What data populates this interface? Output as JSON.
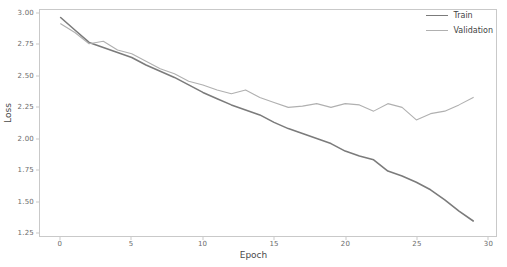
{
  "chart_data": {
    "type": "line",
    "title": "",
    "xlabel": "Epoch",
    "ylabel": "Loss",
    "xlim": [
      -1.45,
      30.6
    ],
    "ylim": [
      1.22,
      3.03
    ],
    "xticks": [
      0,
      5,
      10,
      15,
      20,
      25,
      30
    ],
    "xtick_labels": [
      "0",
      "5",
      "10",
      "15",
      "20",
      "25",
      "30"
    ],
    "yticks": [
      1.25,
      1.5,
      1.75,
      2.0,
      2.25,
      2.5,
      2.75,
      3.0
    ],
    "ytick_labels": [
      "1.25",
      "1.50",
      "1.75",
      "2.00",
      "2.25",
      "2.50",
      "2.75",
      "3.00"
    ],
    "grid": false,
    "legend_position": "upper right",
    "x": [
      0,
      1,
      2,
      3,
      4,
      5,
      6,
      7,
      8,
      9,
      10,
      11,
      12,
      13,
      14,
      15,
      16,
      17,
      18,
      19,
      20,
      21,
      22,
      23,
      24,
      25,
      26,
      27,
      28,
      29
    ],
    "series": [
      {
        "name": "Train",
        "color": "#7b7b7b",
        "linewidth": 1.6,
        "values": [
          2.97,
          2.87,
          2.77,
          2.73,
          2.69,
          2.65,
          2.59,
          2.54,
          2.49,
          2.43,
          2.37,
          2.32,
          2.27,
          2.23,
          2.19,
          2.13,
          2.08,
          2.04,
          2.0,
          1.96,
          1.9,
          1.86,
          1.83,
          1.74,
          1.7,
          1.65,
          1.59,
          1.51,
          1.42,
          1.34
        ]
      },
      {
        "name": "Validation",
        "color": "#b0b0b0",
        "linewidth": 1.1,
        "values": [
          2.92,
          2.85,
          2.76,
          2.78,
          2.71,
          2.68,
          2.62,
          2.56,
          2.52,
          2.46,
          2.43,
          2.39,
          2.36,
          2.39,
          2.33,
          2.29,
          2.25,
          2.26,
          2.28,
          2.25,
          2.28,
          2.27,
          2.22,
          2.28,
          2.25,
          2.15,
          2.2,
          2.22,
          2.27,
          2.33
        ]
      }
    ]
  },
  "legend": {
    "entries": [
      {
        "label": "Train"
      },
      {
        "label": "Validation"
      }
    ]
  },
  "axes": {
    "spine_color": "#c9c9c9",
    "tick_color": "#6b6b6b",
    "label_color": "#4a4a4a"
  }
}
